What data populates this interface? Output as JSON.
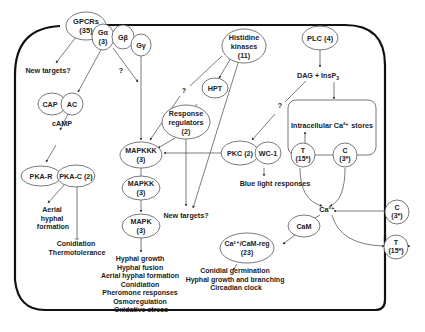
{
  "diagram": {
    "nodes": {
      "gpcrs": {
        "line1": "GPCRs",
        "line2": "(35)"
      },
      "galpha": {
        "line1": "Gα",
        "line2": "(3)"
      },
      "gbeta": {
        "line1": "Gβ"
      },
      "ggamma": {
        "line1": "Gγ"
      },
      "histidine_kinases": {
        "line1": "Histidine",
        "line2": "kinases",
        "line3": "(11)"
      },
      "plc": {
        "line1": "PLC (4)"
      },
      "cap": {
        "line1": "CAP"
      },
      "ac": {
        "line1": "AC"
      },
      "hpt": {
        "line1": "HPT"
      },
      "response_regulators": {
        "line1": "Response",
        "line2": "regulators",
        "line3": "(2)"
      },
      "pka_r": {
        "line1": "PKA-R"
      },
      "pka_c": {
        "line1": "PKA-C (2)"
      },
      "mapkkk": {
        "line1": "MAPKKK",
        "line2": "(3)"
      },
      "mapkk": {
        "line1": "MAPKK",
        "line2": "(3)"
      },
      "mapk": {
        "line1": "MAPK",
        "line2": "(3)"
      },
      "pkc": {
        "line1": "PKC (2)"
      },
      "wc1": {
        "line1": "WC-1"
      },
      "store_t": {
        "line1": "T",
        "line2": "(15*)"
      },
      "store_c": {
        "line1": "C",
        "line2": "(3*)"
      },
      "membrane_c": {
        "line1": "C",
        "line2": "(3*)"
      },
      "membrane_t": {
        "line1": "T",
        "line2": "(15*)"
      },
      "cam": {
        "line1": "CaM"
      },
      "ca_cam_reg": {
        "line1": "Ca²⁺/CaM-reg",
        "line2": "(23)"
      }
    },
    "labels": {
      "new_targets_1": "New targets?",
      "new_targets_2": "New targets?",
      "camp": "cAMP",
      "dag_insp3": "DAG + InsP",
      "dag_insp3_sub": "3",
      "intracellular_stores": "Intracellular Ca²⁺ stores",
      "ca2": "Ca²⁺",
      "blue_light": "Blue light responses",
      "q1": "?",
      "q2": "?",
      "q3": "?",
      "aerial_hyphal_formation": [
        "Aerial",
        "hyphal",
        "formation"
      ],
      "pka_outputs": [
        "Conidiation",
        "Thermotolerance"
      ],
      "mapk_outputs": [
        "Hyphal growth",
        "Hyphal fusion",
        "Aerial hyphal formation",
        "Conidiation",
        "Pheromone responses",
        "Osmoregulation",
        "Oxidative stress"
      ],
      "cam_outputs": [
        "Conidial germination",
        "Hyphal growth and branching",
        "Circadian clock"
      ]
    },
    "colors": {
      "membrane": "#111111",
      "stroke": "#555555",
      "text": "#222222"
    }
  }
}
